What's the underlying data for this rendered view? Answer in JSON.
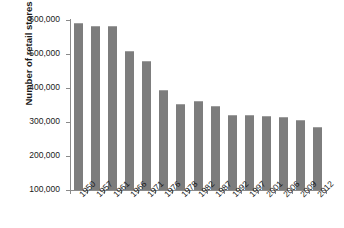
{
  "chart_data": {
    "type": "bar",
    "title": "",
    "xlabel": "",
    "ylabel": "Number of retail stores",
    "ylim": [
      100000,
      600000
    ],
    "ytick_values": [
      100000,
      200000,
      300000,
      400000,
      500000,
      600000
    ],
    "ytick_labels": [
      "100,000",
      "200,000",
      "300,000",
      "400,000",
      "500,000",
      "600,000"
    ],
    "grid": false,
    "legend": "none",
    "bar_color": "#7d7d7d",
    "categories": [
      "1950",
      "1957",
      "1961",
      "1966",
      "1971",
      "1976",
      "1978",
      "1982",
      "1987",
      "1992",
      "1997",
      "2001",
      "2006",
      "2009",
      "2012"
    ],
    "values": [
      590000,
      583000,
      583000,
      510000,
      478000,
      395000,
      353000,
      361000,
      346000,
      322000,
      321000,
      319000,
      316000,
      305000,
      285000
    ],
    "series": [
      {
        "name": "Number of retail stores",
        "values": [
          590000,
          583000,
          583000,
          510000,
          478000,
          395000,
          353000,
          361000,
          346000,
          322000,
          321000,
          319000,
          316000,
          305000,
          285000
        ]
      }
    ]
  }
}
